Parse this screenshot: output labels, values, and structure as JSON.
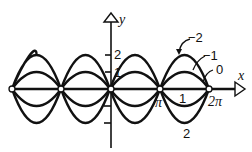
{
  "diagram": {
    "type": "function-family-plot",
    "axes": {
      "x_label": "x",
      "y_label": "y",
      "y_ticks": [
        {
          "value": 2,
          "label": "2"
        },
        {
          "value": 1,
          "label": "1"
        },
        {
          "value": -1,
          "label": ""
        },
        {
          "value": -2,
          "label": ""
        }
      ],
      "x_ticks": [
        {
          "value": "pi",
          "label": "π"
        },
        {
          "value": "2pi",
          "label": "2π"
        }
      ]
    },
    "curve_labels": [
      {
        "c": -2,
        "label": "−2"
      },
      {
        "c": -1,
        "label": "−1"
      },
      {
        "c": 0,
        "label": "0"
      },
      {
        "c": 1,
        "label": "1"
      },
      {
        "c": 2,
        "label": "2"
      }
    ],
    "zero_points": [
      "-2π",
      "-π",
      "0",
      "π",
      "2π"
    ],
    "colors": {
      "ink": "#111111",
      "background": "#ffffff"
    }
  }
}
